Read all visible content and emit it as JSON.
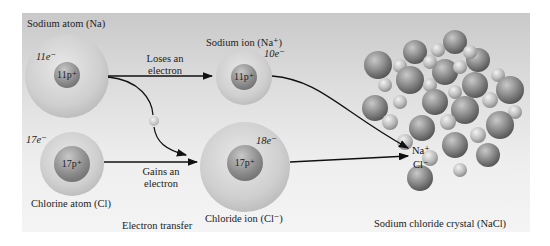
{
  "figure": {
    "title": "Electron transfer",
    "sodium_atom": {
      "label": "Sodium atom (Na)",
      "electrons": "11e⁻",
      "nucleus": "11p⁺"
    },
    "sodium_ion": {
      "label": "Sodium ion (Na⁺)",
      "electrons": "10e⁻",
      "nucleus": "11p⁺"
    },
    "chlorine_atom": {
      "label": "Chlorine atom (Cl)",
      "electrons": "17e⁻",
      "nucleus": "17p⁺"
    },
    "chloride_ion": {
      "label": "Chloride ion (Cl⁻)",
      "electrons": "18e⁻",
      "nucleus": "17p⁺"
    },
    "arrow_top": {
      "line1": "Loses an",
      "line2": "electron"
    },
    "arrow_bottom": {
      "line1": "Gains an",
      "line2": "electron"
    },
    "crystal": {
      "label": "Sodium chloride crystal (NaCl)",
      "na_marker": "Na⁺",
      "cl_marker": "Cl⁻"
    }
  },
  "colors": {
    "background_top": "#c9c9c9",
    "background_bottom": "#f4f4f4",
    "sphere": "#9a9a9a",
    "text": "#222222"
  }
}
